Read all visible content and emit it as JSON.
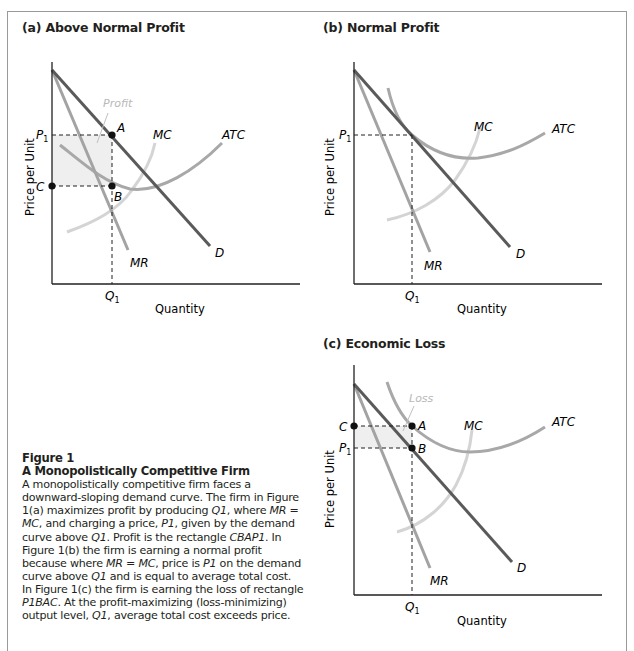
{
  "panels": {
    "a": {
      "title": "(a) Above Normal Profit",
      "ylabel": "Price per Unit",
      "xlabel": "Quantity",
      "labels": {
        "profit": "Profit",
        "P1": "P",
        "P1_sub": "1",
        "C": "C",
        "A": "A",
        "B": "B",
        "MC": "MC",
        "ATC": "ATC",
        "MR": "MR",
        "D": "D",
        "Q1": "Q",
        "Q1_sub": "1"
      }
    },
    "b": {
      "title": "(b) Normal Profit",
      "ylabel": "Price per Unit",
      "xlabel": "Quantity",
      "labels": {
        "P1": "P",
        "P1_sub": "1",
        "MC": "MC",
        "ATC": "ATC",
        "MR": "MR",
        "D": "D",
        "Q1": "Q",
        "Q1_sub": "1"
      }
    },
    "c": {
      "title": "(c) Economic Loss",
      "ylabel": "Price per Unit",
      "xlabel": "Quantity",
      "labels": {
        "loss": "Loss",
        "C": "C",
        "P1": "P",
        "P1_sub": "1",
        "A": "A",
        "B": "B",
        "MC": "MC",
        "ATC": "ATC",
        "MR": "MR",
        "D": "D",
        "Q1": "Q",
        "Q1_sub": "1"
      }
    }
  },
  "caption": {
    "figure": "Figure 1",
    "title": "A Monopolistically Competitive Firm",
    "body": [
      "A monopolistically competitive firm faces a downward-sloping demand curve. The firm in Figure 1(a) maximizes profit by producing ",
      "Q1",
      ", where ",
      "MR = MC",
      ", and charging a price, ",
      "P1",
      ", given by the demand curve above ",
      "Q1",
      ". Profit is the rectangle ",
      "CBAP1",
      ". In Figure 1(b) the firm is earning a normal profit because where ",
      "MR = MC",
      ", price is ",
      "P1",
      " on the demand curve above ",
      "Q1",
      " and is equal to average total cost. In Figure 1(c) the firm is earning the loss of rectangle ",
      "P1BAC",
      ". At the profit-maximizing (loss-minimizing) output level, ",
      "Q1",
      ", average total cost exceeds price."
    ]
  },
  "colors": {
    "demand": "#5a5a5a",
    "mr": "#a3a3a3",
    "atc": "#a8a8a8",
    "mc": "#d4d4d4",
    "axis": "#231f20",
    "area": "#efefef",
    "area_label": "#b8b8b8"
  }
}
